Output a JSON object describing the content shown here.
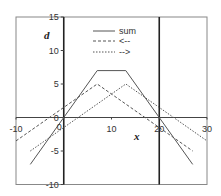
{
  "chart_data": {
    "type": "line",
    "title": "",
    "xlabel": "x",
    "ylabel": "d",
    "xlim": [
      -10,
      30
    ],
    "ylim": [
      -10,
      15
    ],
    "x_ticks": [
      -10,
      0,
      10,
      20,
      30
    ],
    "y_ticks": [
      -10,
      -5,
      0,
      5,
      10,
      15
    ],
    "x_tick_labels": [
      "-10",
      "0",
      "10",
      "20",
      "30"
    ],
    "y_tick_labels": [
      "-10",
      "-5",
      "0",
      "5",
      "10",
      "15"
    ],
    "grid": false,
    "reference_lines": [
      {
        "orientation": "vertical",
        "x": 20
      }
    ],
    "legend_position": "upper center",
    "series": [
      {
        "name": "sum",
        "style": "solid",
        "points": [
          [
            -7,
            -7
          ],
          [
            7,
            7
          ],
          [
            13,
            7
          ],
          [
            27,
            -7
          ]
        ]
      },
      {
        "name": "<--",
        "style": "dashed",
        "points": [
          [
            -10,
            -3.5
          ],
          [
            7,
            5
          ],
          [
            27,
            -5
          ]
        ]
      },
      {
        "name": "-->",
        "style": "dotted",
        "points": [
          [
            -7,
            -5
          ],
          [
            13,
            5
          ],
          [
            30,
            -3.5
          ]
        ]
      }
    ]
  },
  "legend": {
    "items": [
      {
        "label": "sum"
      },
      {
        "label": "<--"
      },
      {
        "label": "-->"
      }
    ]
  },
  "axes": {
    "xlabel": "x",
    "ylabel": "d"
  }
}
